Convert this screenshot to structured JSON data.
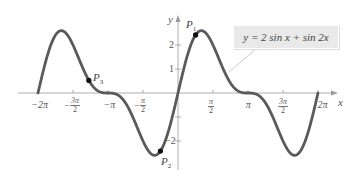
{
  "chart_data": {
    "type": "line",
    "title": "",
    "equation": "y = 2 sin x + sin 2x",
    "xlabel": "x",
    "ylabel": "y",
    "xlim": [
      -6.2832,
      6.2832
    ],
    "ylim": [
      -2.6,
      2.6
    ],
    "grid": false,
    "x_tick_labels": [
      "−2π",
      "−3π/2",
      "−π",
      "−π/2",
      "π/2",
      "π",
      "3π/2",
      "2π"
    ],
    "y_tick_labels": [
      "2",
      "1",
      "−2"
    ],
    "series": [
      {
        "name": "y = 2 sin x + sin 2x",
        "color": "#555555",
        "function": "2*sin(x)+sin(2*x)",
        "domain": [
          -6.2832,
          6.2832
        ]
      }
    ],
    "points": [
      {
        "label": "P1",
        "x": 0.79,
        "y": 2.41
      },
      {
        "label": "P2",
        "x": -0.79,
        "y": -2.41
      },
      {
        "label": "P3",
        "x": -4.0,
        "y": 0.53
      }
    ],
    "annotations": [
      {
        "text": "y = 2 sin x + sin 2x",
        "type": "callout-box",
        "points_to_x": 1.9
      }
    ]
  },
  "labels": {
    "x_axis": "x",
    "y_axis": "y",
    "legend": "y = 2 sin x + sin 2x",
    "p1": "P",
    "p1_sub": "1",
    "p2": "P",
    "p2_sub": "2",
    "p3": "P",
    "p3_sub": "3"
  }
}
